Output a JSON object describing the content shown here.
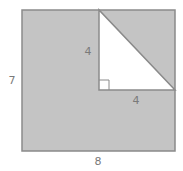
{
  "figure": {
    "rectangle": {
      "width_label": "8",
      "height_label": "7"
    },
    "triangle": {
      "vertical_leg_label": "4",
      "horizontal_leg_label": "4",
      "right_angle": true
    },
    "colors": {
      "shaded": "#c4c4c4",
      "stroke": "#8a8a8a",
      "unshaded": "#ffffff",
      "label": "#7a7a7a"
    }
  }
}
